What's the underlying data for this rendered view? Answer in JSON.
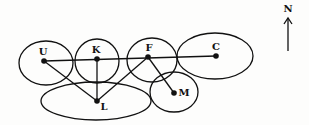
{
  "diagram": {
    "type": "region-adjacency-map",
    "colors": {
      "stroke": "#111111",
      "background": "#fdfdfc"
    },
    "compass": {
      "label": "N",
      "x": 288,
      "y_label": 12,
      "y_top": 18,
      "y_bottom": 51
    },
    "regions": [
      {
        "id": "U",
        "label": "U",
        "cx": 46,
        "cy": 63,
        "rx": 27,
        "ry": 22,
        "dot": [
          44,
          61
        ],
        "label_pos": [
          43,
          55
        ]
      },
      {
        "id": "K",
        "label": "K",
        "cx": 97,
        "cy": 61,
        "rx": 22,
        "ry": 22,
        "dot": [
          97,
          59
        ],
        "label_pos": [
          96,
          53
        ]
      },
      {
        "id": "F",
        "label": "F",
        "cx": 152,
        "cy": 60,
        "rx": 25,
        "ry": 22,
        "dot": [
          148,
          57
        ],
        "label_pos": [
          149,
          51
        ]
      },
      {
        "id": "C",
        "label": "C",
        "cx": 215,
        "cy": 56,
        "rx": 38,
        "ry": 23,
        "dot": [
          216,
          56
        ],
        "label_pos": [
          216,
          50
        ]
      },
      {
        "id": "L",
        "label": "L",
        "cx": 96,
        "cy": 101,
        "rx": 55,
        "ry": 19,
        "dot": [
          97,
          101
        ],
        "label_pos": [
          104,
          110
        ]
      },
      {
        "id": "M",
        "label": "M",
        "cx": 174,
        "cy": 92,
        "rx": 24,
        "ry": 20,
        "dot": [
          174,
          93
        ],
        "label_pos": [
          184,
          96
        ]
      }
    ],
    "edges": [
      {
        "from": "U",
        "to": "C"
      },
      {
        "from": "U",
        "to": "L"
      },
      {
        "from": "K",
        "to": "L"
      },
      {
        "from": "F",
        "to": "L"
      },
      {
        "from": "F",
        "to": "M"
      }
    ]
  }
}
